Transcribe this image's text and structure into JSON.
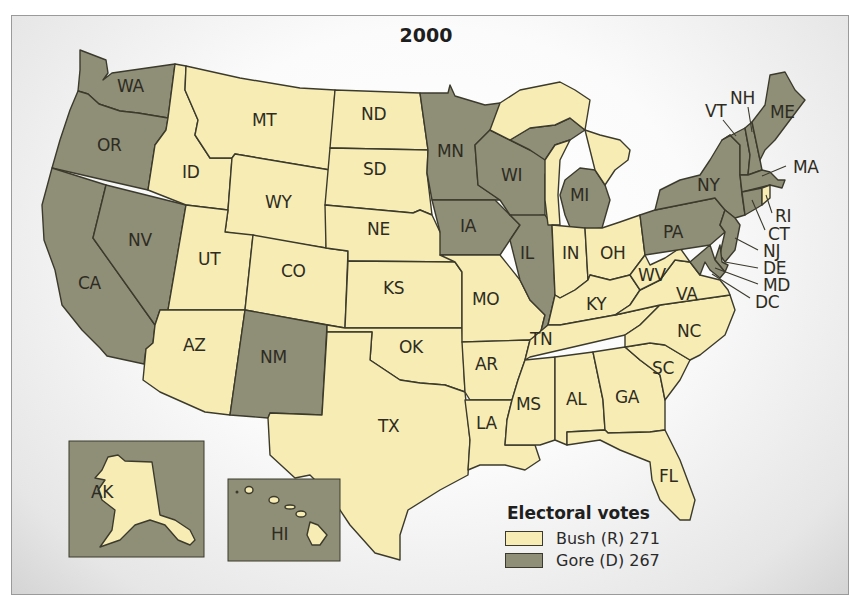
{
  "map": {
    "title": "2000",
    "colors": {
      "bush": "#f7ecb4",
      "gore": "#8f8f78",
      "border": "#3b3a2c"
    },
    "states": {
      "WA": {
        "label": "WA",
        "winner": "gore"
      },
      "OR": {
        "label": "OR",
        "winner": "gore"
      },
      "CA": {
        "label": "CA",
        "winner": "gore"
      },
      "NV": {
        "label": "NV",
        "winner": "bush"
      },
      "ID": {
        "label": "ID",
        "winner": "bush"
      },
      "MT": {
        "label": "MT",
        "winner": "bush"
      },
      "WY": {
        "label": "WY",
        "winner": "bush"
      },
      "UT": {
        "label": "UT",
        "winner": "bush"
      },
      "CO": {
        "label": "CO",
        "winner": "bush"
      },
      "AZ": {
        "label": "AZ",
        "winner": "bush"
      },
      "NM": {
        "label": "NM",
        "winner": "gore"
      },
      "ND": {
        "label": "ND",
        "winner": "bush"
      },
      "SD": {
        "label": "SD",
        "winner": "bush"
      },
      "NE": {
        "label": "NE",
        "winner": "bush"
      },
      "KS": {
        "label": "KS",
        "winner": "bush"
      },
      "OK": {
        "label": "OK",
        "winner": "bush"
      },
      "TX": {
        "label": "TX",
        "winner": "bush"
      },
      "MN": {
        "label": "MN",
        "winner": "gore"
      },
      "IA": {
        "label": "IA",
        "winner": "gore"
      },
      "MO": {
        "label": "MO",
        "winner": "bush"
      },
      "AR": {
        "label": "AR",
        "winner": "bush"
      },
      "LA": {
        "label": "LA",
        "winner": "bush"
      },
      "WI": {
        "label": "WI",
        "winner": "gore"
      },
      "IL": {
        "label": "IL",
        "winner": "gore"
      },
      "MI": {
        "label": "MI",
        "winner": "gore"
      },
      "IN": {
        "label": "IN",
        "winner": "bush"
      },
      "OH": {
        "label": "OH",
        "winner": "bush"
      },
      "KY": {
        "label": "KY",
        "winner": "bush"
      },
      "TN": {
        "label": "TN",
        "winner": "bush"
      },
      "MS": {
        "label": "MS",
        "winner": "bush"
      },
      "AL": {
        "label": "AL",
        "winner": "bush"
      },
      "GA": {
        "label": "GA",
        "winner": "bush"
      },
      "FL": {
        "label": "FL",
        "winner": "bush"
      },
      "SC": {
        "label": "SC",
        "winner": "bush"
      },
      "NC": {
        "label": "NC",
        "winner": "bush"
      },
      "VA": {
        "label": "VA",
        "winner": "bush"
      },
      "WV": {
        "label": "WV",
        "winner": "bush"
      },
      "PA": {
        "label": "PA",
        "winner": "gore"
      },
      "NY": {
        "label": "NY",
        "winner": "gore"
      },
      "VT": {
        "label": "VT",
        "winner": "gore"
      },
      "NH": {
        "label": "NH",
        "winner": "bush"
      },
      "ME": {
        "label": "ME",
        "winner": "gore"
      },
      "MA": {
        "label": "MA",
        "winner": "gore"
      },
      "RI": {
        "label": "RI",
        "winner": "gore"
      },
      "CT": {
        "label": "CT",
        "winner": "gore"
      },
      "NJ": {
        "label": "NJ",
        "winner": "gore"
      },
      "DE": {
        "label": "DE",
        "winner": "gore"
      },
      "MD": {
        "label": "MD",
        "winner": "gore"
      },
      "DC": {
        "label": "DC",
        "winner": "gore"
      },
      "AK": {
        "label": "AK",
        "winner": "bush"
      },
      "HI": {
        "label": "HI",
        "winner": "gore"
      }
    }
  },
  "legend": {
    "title": "Electoral votes",
    "items": [
      {
        "label": "Bush (R) 271",
        "color": "#f7ecb4"
      },
      {
        "label": "Gore (D) 267",
        "color": "#8f8f78"
      }
    ]
  }
}
